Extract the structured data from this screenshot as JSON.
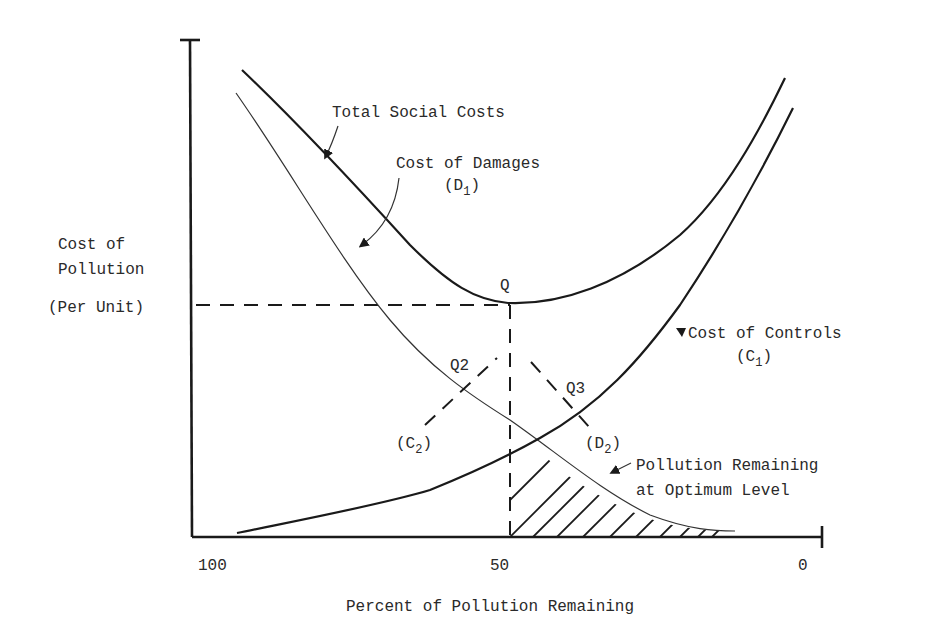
{
  "diagram": {
    "y_axis": {
      "label_lines": [
        "Cost of",
        "Pollution",
        "(Per Unit)"
      ]
    },
    "x_axis": {
      "label": "Percent of Pollution Remaining",
      "ticks": [
        "100",
        "50",
        "0"
      ]
    },
    "curves": {
      "total_social_costs": "Total Social Costs",
      "cost_of_damages": "Cost of Damages",
      "cost_of_damages_symbol": "D",
      "cost_of_damages_sub": "1",
      "cost_of_controls": "Cost of Controls",
      "cost_of_controls_symbol": "C",
      "cost_of_controls_sub": "1",
      "c2_symbol": "C",
      "c2_sub": "2",
      "d2_symbol": "D",
      "d2_sub": "2"
    },
    "points": {
      "q": "Q",
      "q2": "Q2",
      "q3": "Q3"
    },
    "shaded_region_label_lines": [
      "Pollution Remaining",
      "at Optimum Level"
    ],
    "optimum_percent_remaining": 50
  }
}
